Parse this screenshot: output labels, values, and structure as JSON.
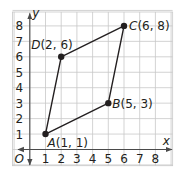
{
  "diagram": {
    "type": "coordinate-plane-quadrilateral",
    "axes": {
      "x_label": "x",
      "y_label": "y",
      "origin_label": "O",
      "x_ticks": [
        "1",
        "2",
        "3",
        "4",
        "5",
        "6",
        "7",
        "8"
      ],
      "y_ticks": [
        "1",
        "2",
        "3",
        "4",
        "5",
        "6",
        "7",
        "8"
      ]
    },
    "points": [
      {
        "name": "A",
        "x": 1,
        "y": 1,
        "coords": "(1, 1)"
      },
      {
        "name": "B",
        "x": 5,
        "y": 3,
        "coords": "(5, 3)"
      },
      {
        "name": "C",
        "x": 6,
        "y": 8,
        "coords": "(6, 8)"
      },
      {
        "name": "D",
        "x": 2,
        "y": 6,
        "coords": "(2, 6)"
      }
    ],
    "polygon_order": [
      "A",
      "B",
      "C",
      "D"
    ],
    "colors": {
      "grid": "#c8c8c8",
      "axis": "#4a4a4a",
      "shape": "#231f20",
      "background": "#ffffff"
    }
  }
}
